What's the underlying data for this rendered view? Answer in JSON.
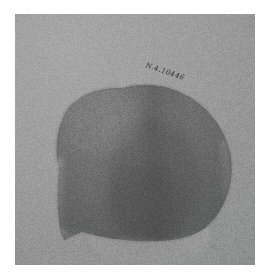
{
  "figure": {
    "caption": "Photograph of a dome-shaped artifact fragment on a plain gray studio backdrop",
    "medium": "black-and-white photographic print",
    "orientation": "portrait"
  },
  "plate": {
    "name": "photographic-plate",
    "page_background": "#ffffff",
    "backdrop_color": "#9d9d9d",
    "backdrop_highlight": "#a6a6a6",
    "backdrop_shadow": "#8e8f8f",
    "margin_px": 15
  },
  "subject": {
    "name": "artifact-fragment",
    "description": "dome or shell shaped fragment with pointed lower-left corner",
    "body_color": "#6b6b6b",
    "body_highlight": "#7c7c7c",
    "core_shadow": "#565656",
    "rim_highlight": "#8e8e8e",
    "edge_line": "#5a5a5a",
    "features": [
      "rounded dome along the upper and right contour",
      "lighter worn rim along the left and lower-left break edge",
      "vertical darker shading band through the center",
      "pointed angular corner at lower left",
      "pale supporting base visible beneath the lower margin"
    ]
  },
  "shadow": {
    "name": "cast-shadow",
    "color": "#3c3c3c",
    "opacity": "0.42"
  },
  "base": {
    "name": "base-support",
    "color": "#afafaf",
    "description": "pale stand or mount supporting the fragment"
  },
  "inscription": {
    "name": "catalogue-inscription",
    "text": "N.4.10446",
    "legibility": "faint, partially illegible cursive",
    "ink_color": "#1a1a1c",
    "rotation_deg": 19
  }
}
